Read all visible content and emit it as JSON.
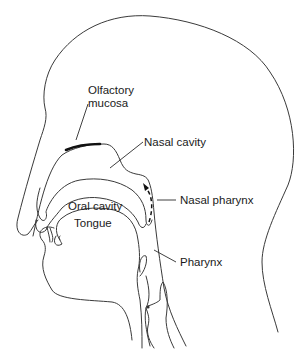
{
  "figure": {
    "type": "anatomical-line-drawing",
    "colors": {
      "line": "#3a3a3a",
      "text": "#1a1a1a",
      "background": "#ffffff",
      "olfactory_highlight": "#111111"
    }
  },
  "labels": {
    "olfactory_mucosa": {
      "line1": "Olfactory",
      "line2": "mucosa"
    },
    "nasal_cavity": "Nasal cavity",
    "nasal_pharynx": "Nasal pharynx",
    "oral_cavity": "Oral cavity",
    "tongue": "Tongue",
    "pharynx": "Pharynx"
  },
  "annotations": {
    "airflow_arrow": "dashed-arrow-up-icon"
  }
}
